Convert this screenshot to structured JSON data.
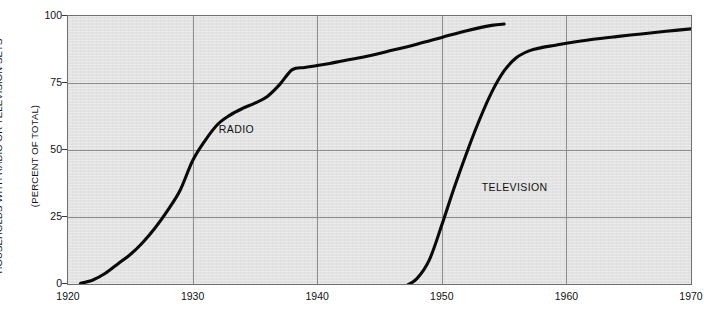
{
  "chart_data": {
    "type": "line",
    "title": "",
    "subtitle": "",
    "xlabel": "",
    "ylabel": "HOUSEHOLDS WITH RADIO OR TELEVISION SETS\n(PERCENT OF TOTAL)",
    "ylabel_line1": "HOUSEHOLDS WITH RADIO OR TELEVISION SETS",
    "ylabel_line2": "(PERCENT OF TOTAL)",
    "xlim": [
      1920,
      1970
    ],
    "ylim": [
      0,
      100
    ],
    "grid": true,
    "legend_position": "inline-annotation",
    "background_color": "#e3e3e3",
    "line_color": "#0a0a0a",
    "grid_color": "#8c8c8c",
    "border_color": "#6f6f6f",
    "xticks": [
      1920,
      1930,
      1940,
      1950,
      1960,
      1970
    ],
    "xticklabels": [
      "1920",
      "1930",
      "1940",
      "1950",
      "1960",
      "1970"
    ],
    "yticks": [
      0,
      25,
      50,
      75,
      100
    ],
    "yticklabels": [
      "0",
      "25",
      "50",
      "75",
      "100"
    ],
    "annotations": [
      {
        "text": "RADIO",
        "x": 1932.1,
        "y": 57.5
      },
      {
        "text": "TELEVISION",
        "x": 1953.2,
        "y": 36.0
      }
    ],
    "series": [
      {
        "name": "RADIO",
        "label": "RADIO",
        "x": [
          1921.0,
          1922.0,
          1923.0,
          1924.0,
          1925.0,
          1926.0,
          1927.0,
          1928.0,
          1929.0,
          1930.0,
          1931.0,
          1932.0,
          1933.0,
          1934.0,
          1935.0,
          1936.0,
          1937.0,
          1938.0,
          1939.0,
          1940.0,
          1941.0,
          1942.0,
          1944.0,
          1946.0,
          1948.0,
          1950.0,
          1952.0,
          1954.0,
          1955.0
        ],
        "values": [
          0.2,
          1.5,
          4.0,
          7.5,
          11.0,
          15.5,
          21.0,
          27.5,
          35.0,
          46.0,
          53.5,
          59.5,
          63.0,
          65.5,
          67.5,
          70.0,
          74.5,
          80.0,
          80.8,
          81.5,
          82.3,
          83.2,
          85.0,
          87.2,
          89.5,
          92.0,
          94.5,
          96.5,
          97.0
        ]
      },
      {
        "name": "TELEVISION",
        "label": "TELEVISION",
        "x": [
          1947.0,
          1948.0,
          1949.0,
          1950.0,
          1951.0,
          1952.0,
          1953.0,
          1954.0,
          1955.0,
          1956.0,
          1957.0,
          1958.0,
          1959.0,
          1960.0,
          1962.0,
          1964.0,
          1966.0,
          1968.0,
          1970.0
        ],
        "values": [
          -1.0,
          2.0,
          9.0,
          22.0,
          36.0,
          49.0,
          61.0,
          71.5,
          79.5,
          84.5,
          87.0,
          88.2,
          89.0,
          89.8,
          91.2,
          92.3,
          93.3,
          94.3,
          95.2
        ]
      }
    ]
  }
}
